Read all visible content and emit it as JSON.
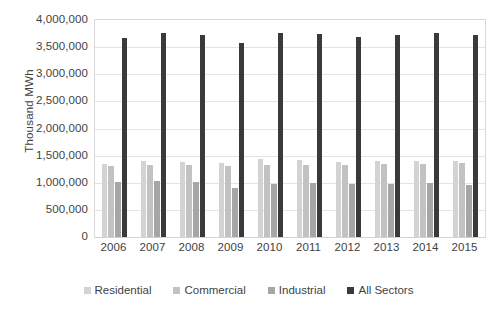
{
  "chart_data": {
    "type": "bar",
    "title": "",
    "subtitle": "",
    "xlabel": "",
    "ylabel": "Thousand MWh",
    "ylim": [
      0,
      4000000
    ],
    "ytick_step": 500000,
    "ytick_labels": [
      "4,000,000",
      "3,500,000",
      "3,000,000",
      "2,500,000",
      "2,000,000",
      "1,500,000",
      "1,000,000",
      "500,000",
      "0"
    ],
    "ytick_values": [
      4000000,
      3500000,
      3000000,
      2500000,
      2000000,
      1500000,
      1000000,
      500000,
      0
    ],
    "grid": true,
    "grid_axis": "y",
    "legend_position": "bottom",
    "categories": [
      "2006",
      "2007",
      "2008",
      "2009",
      "2010",
      "2011",
      "2012",
      "2013",
      "2014",
      "2015"
    ],
    "series": [
      {
        "name": "Residential",
        "color": "#d3d3d3",
        "values": [
          1351000,
          1392000,
          1380000,
          1364000,
          1446000,
          1423000,
          1375000,
          1395000,
          1407000,
          1404000
        ]
      },
      {
        "name": "Commercial",
        "color": "#c2c2c2",
        "values": [
          1300000,
          1336000,
          1336000,
          1307000,
          1330000,
          1328000,
          1327000,
          1337000,
          1352000,
          1358000
        ]
      },
      {
        "name": "Industrial",
        "color": "#a6a6a6",
        "values": [
          1011000,
          1028000,
          1010000,
          897000,
          971000,
          991000,
          975000,
          983000,
          998000,
          956000
        ]
      },
      {
        "name": "All Sectors",
        "color": "#3a3a3a",
        "values": [
          3670000,
          3765000,
          3733000,
          3580000,
          3755000,
          3750000,
          3694000,
          3725000,
          3765000,
          3724000
        ]
      }
    ]
  },
  "legend": {
    "items": [
      {
        "label": "Residential",
        "color": "#d3d3d3"
      },
      {
        "label": "Commercial",
        "color": "#c2c2c2"
      },
      {
        "label": "Industrial",
        "color": "#a6a6a6"
      },
      {
        "label": "All Sectors",
        "color": "#3a3a3a"
      }
    ]
  }
}
